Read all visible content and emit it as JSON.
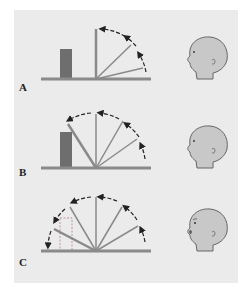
{
  "figure": {
    "background": "#ebebeb",
    "colors": {
      "bar": "#6e6e6e",
      "rod": "#8a8a8a",
      "baseline": "#8a8a8a",
      "arrow": "#222222",
      "head_fill": "#c8c8c8"
    },
    "panels": [
      {
        "label": "A",
        "description": "Rod rotates up from horizontal to vertical; block stands beside, rod does not pass through it",
        "expression": "closed mouth"
      },
      {
        "label": "B",
        "description": "Rod rotates past vertical and stops against the block",
        "expression": "closed mouth"
      },
      {
        "label": "C",
        "description": "Rod rotates through full 180 degrees; block shown as dashed outline (removed), rod passes through its position",
        "expression": "surprised, open mouth"
      }
    ]
  }
}
